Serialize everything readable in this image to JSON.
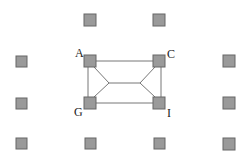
{
  "diagram": {
    "type": "grid-graph",
    "colors": {
      "node_fill": "#9a9a9a",
      "node_stroke": "#666666",
      "edge": "#777777",
      "label": "#222222"
    },
    "nodes": [
      {
        "id": "t1",
        "x": 84,
        "y": 14,
        "label": ""
      },
      {
        "id": "t2",
        "x": 153,
        "y": 14,
        "label": ""
      },
      {
        "id": "A",
        "x": 84,
        "y": 55,
        "label": "A"
      },
      {
        "id": "C",
        "x": 153,
        "y": 55,
        "label": "C"
      },
      {
        "id": "l1",
        "x": 16,
        "y": 56,
        "label": ""
      },
      {
        "id": "r1",
        "x": 223,
        "y": 55,
        "label": ""
      },
      {
        "id": "G",
        "x": 84,
        "y": 97,
        "label": "G"
      },
      {
        "id": "I",
        "x": 153,
        "y": 97,
        "label": "I"
      },
      {
        "id": "l2",
        "x": 16,
        "y": 98,
        "label": ""
      },
      {
        "id": "r2",
        "x": 223,
        "y": 97,
        "label": ""
      },
      {
        "id": "b1",
        "x": 16,
        "y": 138,
        "label": ""
      },
      {
        "id": "b2",
        "x": 85,
        "y": 138,
        "label": ""
      },
      {
        "id": "b3",
        "x": 154,
        "y": 138,
        "label": ""
      },
      {
        "id": "b4",
        "x": 223,
        "y": 138,
        "label": ""
      }
    ],
    "labels": {
      "A": "A",
      "C": "C",
      "G": "G",
      "I": "I"
    },
    "edges": [
      [
        "A",
        "C"
      ],
      [
        "G",
        "I"
      ],
      [
        "A",
        "G"
      ],
      [
        "C",
        "I"
      ],
      [
        "A",
        "J1"
      ],
      [
        "G",
        "J1"
      ],
      [
        "J1",
        "J2"
      ],
      [
        "C",
        "J2"
      ],
      [
        "I",
        "J2"
      ]
    ],
    "junctions": [
      {
        "id": "J1",
        "x": 109,
        "y": 83
      },
      {
        "id": "J2",
        "x": 140,
        "y": 83
      }
    ]
  }
}
